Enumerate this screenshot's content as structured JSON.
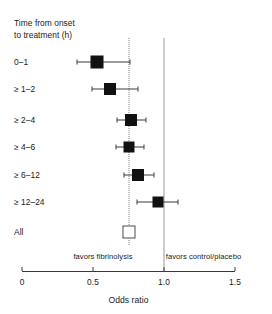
{
  "chart_data": {
    "type": "scatter",
    "subtype": "forest-plot",
    "title": "Time from onset\nto treatment (h)",
    "xlabel": "Odds ratio",
    "ylabel": "",
    "xlim": [
      0,
      1.5
    ],
    "xticks": [
      0,
      0.5,
      1.0,
      1.5
    ],
    "xticklabels": [
      "0",
      "0.5",
      "1.0",
      "1.5"
    ],
    "grid": false,
    "legend": null,
    "null_line": 1.0,
    "pooled_line": 0.75,
    "annotations": {
      "left": "favors fibrinolysis",
      "right": "favors control/placebo"
    },
    "categories": [
      "0–1",
      "≥ 1–2",
      "≥ 2–4",
      "≥ 4–6",
      "≥ 6–12",
      "≥ 12–24",
      "All"
    ],
    "points": [
      {
        "label": "0–1",
        "estimate": 0.53,
        "ci_low": 0.39,
        "ci_high": 0.76,
        "marker": "filled",
        "size": 13
      },
      {
        "label": "≥ 1–2",
        "estimate": 0.62,
        "ci_low": 0.49,
        "ci_high": 0.82,
        "marker": "filled",
        "size": 12
      },
      {
        "label": "≥ 2–4",
        "estimate": 0.77,
        "ci_low": 0.67,
        "ci_high": 0.87,
        "marker": "filled",
        "size": 12
      },
      {
        "label": "≥ 4–6",
        "estimate": 0.75,
        "ci_low": 0.66,
        "ci_high": 0.86,
        "marker": "filled",
        "size": 11
      },
      {
        "label": "≥ 6–12",
        "estimate": 0.82,
        "ci_low": 0.72,
        "ci_high": 0.93,
        "marker": "filled",
        "size": 12
      },
      {
        "label": "≥ 12–24",
        "estimate": 0.96,
        "ci_low": 0.81,
        "ci_high": 1.1,
        "marker": "filled",
        "size": 11
      },
      {
        "label": "All",
        "estimate": 0.75,
        "ci_low": 0.72,
        "ci_high": 0.79,
        "marker": "hollow",
        "size": 13
      }
    ]
  }
}
